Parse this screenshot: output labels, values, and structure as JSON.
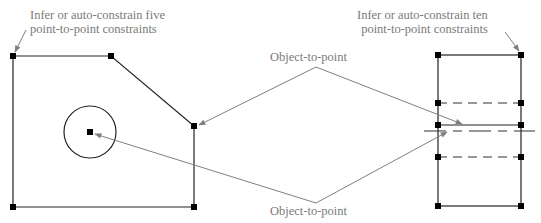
{
  "labels": {
    "top_left": [
      "Infer or auto-constrain five",
      "point-to-point constraints"
    ],
    "top_right": [
      "Infer or auto-constrain ten",
      "point-to-point constraints"
    ],
    "middle_top": "Object-to-point",
    "middle_bottom": "Object-to-point"
  },
  "colors": {
    "geometry": "#222222",
    "leader": "#808080",
    "text": "#7a7a7a",
    "point": "#000000"
  },
  "left_shape": {
    "vertices": [
      [
        13,
        56
      ],
      [
        111,
        56
      ],
      [
        194,
        126
      ],
      [
        194,
        207
      ],
      [
        13,
        207
      ]
    ],
    "circle": {
      "cx": 90,
      "cy": 132,
      "r": 26
    },
    "center_point": [
      90,
      132
    ]
  },
  "right_shape": {
    "x_left": 438,
    "x_right": 521,
    "y_top": 55,
    "y_dash1": 103,
    "y_solid": 125,
    "y_ext": 131,
    "y_dash2": 157,
    "y_bottom": 206,
    "ext_line_x": [
      424,
      535
    ]
  }
}
